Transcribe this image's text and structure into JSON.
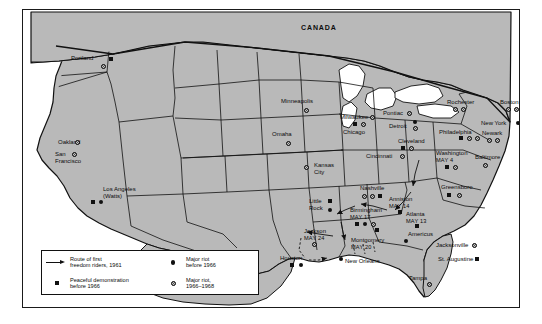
{
  "figure": {
    "frame_color": "#1a1a1a",
    "land_color": "#b9b9b9",
    "water_color": "#ffffff",
    "ink_color": "#111111"
  },
  "country_labels": [
    {
      "name": "CANADA",
      "text": "CANADA",
      "x": 278,
      "y": 14
    },
    {
      "name": "MEXICO",
      "text": "MEXICO",
      "x": 129,
      "y": 239
    }
  ],
  "legend": {
    "items": [
      {
        "glyph": "arrow-icon",
        "label": "Route of first\nfreedom riders, 1961"
      },
      {
        "glyph": "square-icon",
        "label": "Peaceful demonstration\nbefore 1966"
      },
      {
        "glyph": "dot-icon",
        "label": "Major riot\nbefore 1966"
      },
      {
        "glyph": "ring-icon",
        "label": "Major riot,\n1966–1968"
      }
    ]
  },
  "cities": [
    {
      "name": "Portland",
      "label": "Portland",
      "date": "",
      "x": 48,
      "y": 45,
      "align": "left",
      "markers": [
        {
          "t": "sq",
          "x": 86,
          "y": 47
        },
        {
          "t": "ring",
          "x": 78,
          "y": 54
        }
      ]
    },
    {
      "name": "Oakland",
      "label": "Oakland",
      "date": "",
      "x": 35,
      "y": 129,
      "align": "left",
      "markers": [
        {
          "t": "ring",
          "x": 52,
          "y": 130
        }
      ]
    },
    {
      "name": "San Francisco",
      "label": "San\nFrancisco",
      "date": "",
      "x": 32,
      "y": 141,
      "align": "left",
      "markers": [
        {
          "t": "ring",
          "x": 49,
          "y": 142
        }
      ]
    },
    {
      "name": "Los Angeles",
      "label": "Los Angeles\n(Watts)",
      "date": "",
      "x": 80,
      "y": 176,
      "align": "left",
      "markers": [
        {
          "t": "sq",
          "x": 68,
          "y": 190
        },
        {
          "t": "dot",
          "x": 76,
          "y": 190
        }
      ]
    },
    {
      "name": "Minneapolis",
      "label": "Minneapolis",
      "date": "",
      "x": 258,
      "y": 88,
      "align": "left",
      "markers": [
        {
          "t": "ring",
          "x": 281,
          "y": 98
        }
      ]
    },
    {
      "name": "Omaha",
      "label": "Omaha",
      "date": "",
      "x": 249,
      "y": 121,
      "align": "left",
      "markers": [
        {
          "t": "ring",
          "x": 263,
          "y": 131
        }
      ]
    },
    {
      "name": "Kansas City",
      "label": "Kansas\nCity",
      "date": "",
      "x": 291,
      "y": 152,
      "align": "left",
      "markers": [
        {
          "t": "ring",
          "x": 281,
          "y": 155
        }
      ]
    },
    {
      "name": "Milwaukee",
      "label": "Milwaukee",
      "date": "",
      "x": 317,
      "y": 104,
      "align": "left",
      "markers": [
        {
          "t": "ring",
          "x": 347,
          "y": 105
        }
      ]
    },
    {
      "name": "Chicago",
      "label": "Chicago",
      "date": "",
      "x": 320,
      "y": 119,
      "align": "left",
      "markers": [
        {
          "t": "sq",
          "x": 330,
          "y": 112
        },
        {
          "t": "ring",
          "x": 338,
          "y": 112
        }
      ]
    },
    {
      "name": "Pontiac",
      "label": "Pontiac",
      "date": "",
      "x": 360,
      "y": 100,
      "align": "left",
      "markers": [
        {
          "t": "ring",
          "x": 384,
          "y": 101
        }
      ]
    },
    {
      "name": "Detroit",
      "label": "Detroit",
      "date": "",
      "x": 366,
      "y": 113,
      "align": "left",
      "markers": [
        {
          "t": "dot",
          "x": 390,
          "y": 110
        },
        {
          "t": "ring",
          "x": 390,
          "y": 116
        }
      ]
    },
    {
      "name": "Cleveland",
      "label": "Cleveland",
      "date": "",
      "x": 375,
      "y": 128,
      "align": "left",
      "markers": [
        {
          "t": "sq",
          "x": 378,
          "y": 136
        },
        {
          "t": "ring",
          "x": 386,
          "y": 136
        }
      ]
    },
    {
      "name": "Cincinnati",
      "label": "Cincinnati",
      "date": "",
      "x": 343,
      "y": 143,
      "align": "left",
      "markers": [
        {
          "t": "ring",
          "x": 377,
          "y": 144
        }
      ]
    },
    {
      "name": "Rochester",
      "label": "Rochester",
      "date": "",
      "x": 424,
      "y": 89,
      "align": "left",
      "markers": [
        {
          "t": "ring",
          "x": 430,
          "y": 97
        },
        {
          "t": "ring",
          "x": 438,
          "y": 97
        }
      ]
    },
    {
      "name": "Boston",
      "label": "Boston",
      "date": "",
      "x": 477,
      "y": 89,
      "align": "left",
      "markers": [
        {
          "t": "ring",
          "x": 483,
          "y": 97
        },
        {
          "t": "ring",
          "x": 491,
          "y": 97
        }
      ]
    },
    {
      "name": "New York",
      "label": "New York",
      "date": "",
      "x": 458,
      "y": 110,
      "align": "left",
      "markers": [
        {
          "t": "dot",
          "x": 493,
          "y": 111
        },
        {
          "t": "dot",
          "x": 500,
          "y": 111
        },
        {
          "t": "ring",
          "x": 507,
          "y": 111
        }
      ]
    },
    {
      "name": "Newark",
      "label": "Newark",
      "date": "",
      "x": 459,
      "y": 120,
      "align": "left",
      "markers": [
        {
          "t": "ring",
          "x": 464,
          "y": 128
        },
        {
          "t": "ring",
          "x": 472,
          "y": 128
        }
      ]
    },
    {
      "name": "Philadelphia",
      "label": "Philadelphia",
      "date": "",
      "x": 416,
      "y": 119,
      "align": "left",
      "markers": [
        {
          "t": "sq",
          "x": 436,
          "y": 126
        },
        {
          "t": "ring",
          "x": 444,
          "y": 126
        },
        {
          "t": "ring",
          "x": 452,
          "y": 126
        }
      ]
    },
    {
      "name": "Washington",
      "label": "Washington",
      "date": "MAY 4",
      "x": 413,
      "y": 140,
      "align": "left",
      "markers": [
        {
          "t": "sq",
          "x": 422,
          "y": 155
        },
        {
          "t": "ring",
          "x": 430,
          "y": 155
        }
      ]
    },
    {
      "name": "Baltimore",
      "label": "Baltimore",
      "date": "",
      "x": 452,
      "y": 144,
      "align": "left",
      "markers": [
        {
          "t": "ring",
          "x": 460,
          "y": 153
        }
      ]
    },
    {
      "name": "Greensboro",
      "label": "Greensboro",
      "date": "",
      "x": 418,
      "y": 174,
      "align": "left",
      "markers": [
        {
          "t": "sq",
          "x": 424,
          "y": 183
        },
        {
          "t": "ring",
          "x": 434,
          "y": 183
        }
      ]
    },
    {
      "name": "Nashville",
      "label": "Nashville",
      "date": "",
      "x": 337,
      "y": 175,
      "align": "left",
      "markers": [
        {
          "t": "ring",
          "x": 339,
          "y": 184
        },
        {
          "t": "ring",
          "x": 347,
          "y": 184
        },
        {
          "t": "sq",
          "x": 355,
          "y": 184
        }
      ]
    },
    {
      "name": "Little Rock",
      "label": "Little\nRock",
      "date": "",
      "x": 286,
      "y": 188,
      "align": "left",
      "markers": [
        {
          "t": "sq",
          "x": 305,
          "y": 189
        },
        {
          "t": "dot",
          "x": 305,
          "y": 198
        }
      ]
    },
    {
      "name": "Birmingham",
      "label": "Birmingham",
      "date": "MAY 17",
      "x": 327,
      "y": 197,
      "align": "left",
      "markers": [
        {
          "t": "sq",
          "x": 332,
          "y": 212
        },
        {
          "t": "dot",
          "x": 340,
          "y": 212
        },
        {
          "t": "ring",
          "x": 348,
          "y": 212
        }
      ]
    },
    {
      "name": "Anniston",
      "label": "Anniston",
      "date": "MAY 14",
      "x": 366,
      "y": 186,
      "align": "left",
      "markers": [
        {
          "t": "sq",
          "x": 375,
          "y": 200
        }
      ]
    },
    {
      "name": "Atlanta",
      "label": "Atlanta",
      "date": "MAY 13",
      "x": 383,
      "y": 201,
      "align": "left",
      "markers": [
        {
          "t": "sq",
          "x": 392,
          "y": 214
        }
      ]
    },
    {
      "name": "Americus",
      "label": "Americus",
      "date": "",
      "x": 385,
      "y": 221,
      "align": "left",
      "markers": [
        {
          "t": "dot",
          "x": 381,
          "y": 229
        }
      ]
    },
    {
      "name": "Jackson",
      "label": "Jackson",
      "date": "MAY 24",
      "x": 281,
      "y": 218,
      "align": "left",
      "markers": [
        {
          "t": "ring",
          "x": 289,
          "y": 232
        }
      ]
    },
    {
      "name": "Montgomery",
      "label": "Montgomery",
      "date": "MAY 20",
      "x": 328,
      "y": 227,
      "align": "left",
      "markers": [
        {
          "t": "sq",
          "x": 352,
          "y": 218
        }
      ]
    },
    {
      "name": "New Orleans",
      "label": "New Orleans",
      "date": "",
      "x": 322,
      "y": 248,
      "align": "left",
      "markers": [
        {
          "t": "dot",
          "x": 316,
          "y": 247
        }
      ]
    },
    {
      "name": "Houston",
      "label": "Houston",
      "date": "",
      "x": 257,
      "y": 245,
      "align": "left",
      "markers": [
        {
          "t": "sq",
          "x": 267,
          "y": 253
        },
        {
          "t": "dot",
          "x": 276,
          "y": 253
        }
      ]
    },
    {
      "name": "Jacksonville",
      "label": "Jacksonville",
      "date": "",
      "x": 413,
      "y": 232,
      "align": "left",
      "markers": [
        {
          "t": "ring",
          "x": 449,
          "y": 233
        }
      ]
    },
    {
      "name": "St. Augustine",
      "label": "St. Augustine",
      "date": "",
      "x": 415,
      "y": 246,
      "align": "left",
      "markers": [
        {
          "t": "sq",
          "x": 452,
          "y": 247
        }
      ]
    },
    {
      "name": "Tampa",
      "label": "Tampa",
      "date": "",
      "x": 386,
      "y": 265,
      "align": "left",
      "markers": [
        {
          "t": "ring",
          "x": 404,
          "y": 272
        }
      ]
    }
  ]
}
